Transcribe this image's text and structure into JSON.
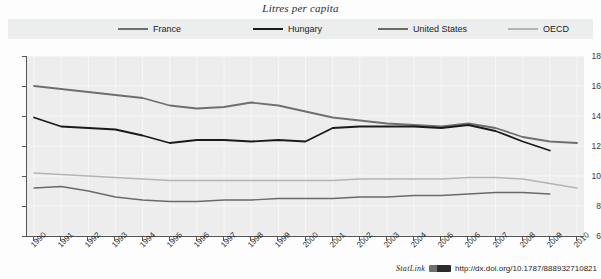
{
  "chart_title": "Litres per capita",
  "legend": {
    "items": [
      {
        "name": "france",
        "label": "France",
        "color": "#6f6f6f"
      },
      {
        "name": "hungary",
        "label": "Hungary",
        "color": "#1a1a1a"
      },
      {
        "name": "us",
        "label": "United States",
        "color": "#6a6a6a"
      },
      {
        "name": "oecd",
        "label": "OECD",
        "color": "#b4b4b4"
      }
    ]
  },
  "footer": {
    "statlink_word": "StatLink",
    "badge_icon": "statlink-badge-icon",
    "url": "http://dx.doi.org/10.1787/888932710821"
  },
  "chart_data": {
    "type": "line",
    "title": "Litres per capita",
    "xlabel": "",
    "ylabel": "",
    "ylim": [
      6,
      18
    ],
    "ytick_values": [
      6,
      8,
      10,
      12,
      14,
      16,
      18
    ],
    "ytick_labels": [
      "6",
      "8",
      "10",
      "12",
      "14",
      "16",
      "18"
    ],
    "grid": true,
    "legend_position": "top",
    "x": [
      1990,
      1991,
      1992,
      1993,
      1994,
      1995,
      1996,
      1997,
      1998,
      1999,
      2000,
      2001,
      2002,
      2003,
      2004,
      2005,
      2006,
      2007,
      2008,
      2009,
      2010
    ],
    "xtick_labels": [
      "1990",
      "1991",
      "1992",
      "1993",
      "1994",
      "1995",
      "1996",
      "1997",
      "1998",
      "1999",
      "2000",
      "2001",
      "2002",
      "2003",
      "2004",
      "2005",
      "2006",
      "2007",
      "2008",
      "2009",
      "2010"
    ],
    "series": [
      {
        "name": "France",
        "color": "#6f6f6f",
        "width": 1.8,
        "values": [
          16.0,
          15.8,
          15.6,
          15.4,
          15.2,
          14.7,
          14.5,
          14.6,
          14.9,
          14.7,
          14.3,
          13.9,
          13.7,
          13.5,
          13.4,
          13.3,
          13.5,
          13.2,
          12.6,
          12.3,
          12.2
        ]
      },
      {
        "name": "Hungary",
        "color": "#1a1a1a",
        "width": 1.8,
        "values": [
          13.9,
          13.3,
          13.2,
          13.1,
          12.7,
          12.2,
          12.4,
          12.4,
          12.3,
          12.4,
          12.3,
          13.2,
          13.3,
          13.3,
          13.3,
          13.2,
          13.4,
          13.0,
          12.3,
          11.7,
          null
        ]
      },
      {
        "name": "United States",
        "color": "#6a6a6a",
        "width": 1.4,
        "values": [
          9.2,
          9.3,
          9.0,
          8.6,
          8.4,
          8.3,
          8.3,
          8.4,
          8.4,
          8.5,
          8.5,
          8.5,
          8.6,
          8.6,
          8.7,
          8.7,
          8.8,
          8.9,
          8.9,
          8.8,
          null
        ]
      },
      {
        "name": "OECD",
        "color": "#b4b4b4",
        "width": 1.4,
        "values": [
          10.2,
          10.1,
          10.0,
          9.9,
          9.8,
          9.7,
          9.7,
          9.7,
          9.7,
          9.7,
          9.7,
          9.7,
          9.8,
          9.8,
          9.8,
          9.8,
          9.9,
          9.9,
          9.8,
          9.5,
          9.2
        ]
      }
    ]
  }
}
